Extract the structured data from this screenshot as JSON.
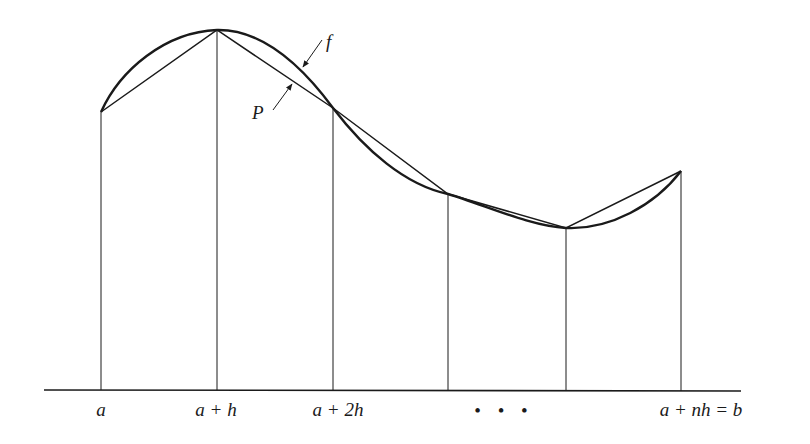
{
  "diagram": {
    "curve_label": "f",
    "polygon_label": "P",
    "x_axis": {
      "tick_labels": [
        "a",
        "a + h",
        "a + 2h",
        "• • •",
        "a + nh = b"
      ]
    },
    "nodes": [
      {
        "x": 101,
        "y": 112
      },
      {
        "x": 217,
        "y": 30
      },
      {
        "x": 333,
        "y": 108
      },
      {
        "x": 448,
        "y": 194
      },
      {
        "x": 566,
        "y": 228
      },
      {
        "x": 681,
        "y": 171
      }
    ],
    "colors": {
      "ink": "#1a1a1a",
      "background": "#ffffff"
    }
  }
}
